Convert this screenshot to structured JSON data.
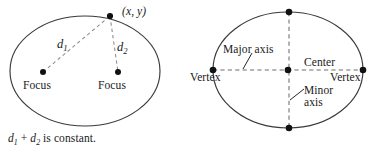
{
  "figure": {
    "background_color": "#ffffff",
    "stroke_color": "#3a3a3a",
    "dash_color": "#8c8c8c",
    "dot_color": "#111111",
    "text_color": "#1a1a1a",
    "left_diagram": {
      "name": "ellipse-foci-definition",
      "point_label": "(x, y)",
      "distance_1": "d",
      "distance_1_sub": "1",
      "distance_2": "d",
      "distance_2_sub": "2",
      "focus_left_label": "Focus",
      "focus_right_label": "Focus",
      "caption_prefix": "d",
      "caption_sub_1": "1",
      "caption_plus": " + ",
      "caption_mid": "d",
      "caption_sub_2": "2",
      "caption_suffix": " is constant.",
      "caption_full": "d1 + d2 is constant.",
      "ellipse": {
        "cx": 85,
        "cy": 71,
        "rx": 75,
        "ry": 55
      },
      "points": [
        {
          "name": "point-xy",
          "x": 110,
          "y": 16
        },
        {
          "name": "focus-left",
          "x": 43,
          "y": 72
        },
        {
          "name": "focus-right",
          "x": 118,
          "y": 72
        }
      ]
    },
    "right_diagram": {
      "name": "ellipse-axes-labels",
      "major_axis_label": "Major axis",
      "minor_axis_label_line1": "Minor",
      "minor_axis_label_line2": "axis",
      "minor_axis_label": "Minor axis",
      "center_label": "Center",
      "vertex_left_label": "Vertex",
      "vertex_right_label": "Vertex",
      "ellipse": {
        "cx": 288,
        "cy": 70,
        "rx": 75,
        "ry": 58
      },
      "points": [
        {
          "name": "vertex-left",
          "x": 213,
          "y": 70
        },
        {
          "name": "vertex-right",
          "x": 363,
          "y": 70
        },
        {
          "name": "co-vertex-top",
          "x": 289,
          "y": 12
        },
        {
          "name": "co-vertex-bottom",
          "x": 289,
          "y": 128
        },
        {
          "name": "center",
          "x": 288,
          "y": 70
        }
      ]
    }
  }
}
